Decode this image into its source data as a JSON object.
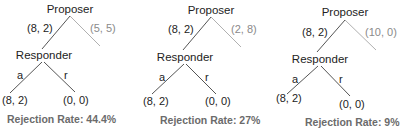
{
  "colors": {
    "text": "#222222",
    "alt_offer": "#8a8a8a",
    "edge": "#555555",
    "edge_alt": "#b0b0b0",
    "rate_text": "#6b6b6b"
  },
  "panels": [
    {
      "proposer_label": "Proposer",
      "offer_label": "(8, 2)",
      "alt_offer_label": "(5, 5)",
      "responder_label": "Responder",
      "accept_label": "a",
      "reject_label": "r",
      "accept_payoff": "(8, 2)",
      "reject_payoff": "(0, 0)",
      "rejection_rate": "Rejection Rate: 44.4%"
    },
    {
      "proposer_label": "Proposer",
      "offer_label": "(8, 2)",
      "alt_offer_label": "(2, 8)",
      "responder_label": "Responder",
      "accept_label": "a",
      "reject_label": "r",
      "accept_payoff": "(8, 2)",
      "reject_payoff": "(0, 0)",
      "rejection_rate": "Rejection Rate: 27%"
    },
    {
      "proposer_label": "Proposer",
      "offer_label": "(8, 2)",
      "alt_offer_label": "(10, 0)",
      "responder_label": "Responder",
      "accept_label": "a",
      "reject_label": "r",
      "accept_payoff": "(8, 2)",
      "reject_payoff": "(0, 0)",
      "rejection_rate": "Rejection Rate: 9%"
    }
  ]
}
